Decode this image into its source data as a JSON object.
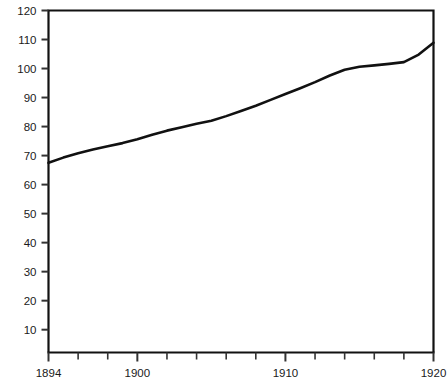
{
  "chart_data": {
    "type": "line",
    "title": "",
    "subtitle": "",
    "xlabel": "",
    "ylabel": "",
    "xlim": [
      1894,
      1920
    ],
    "ylim": [
      0,
      120
    ],
    "grid": false,
    "legend": null,
    "x_major_ticks": [
      1894,
      1900,
      1910,
      1920
    ],
    "x_major_tick_labels": [
      "1894",
      "1900",
      "1910",
      "1920"
    ],
    "x_minor_ticks": [
      1896,
      1898,
      1902,
      1904,
      1906,
      1908,
      1912,
      1914,
      1916,
      1918
    ],
    "y_ticks": [
      10,
      20,
      30,
      40,
      50,
      60,
      70,
      80,
      90,
      100,
      110,
      120
    ],
    "y_tick_labels": [
      "10",
      "20",
      "30",
      "40",
      "50",
      "60",
      "70",
      "80",
      "90",
      "100",
      "110",
      "120"
    ],
    "series": [
      {
        "name": "series-1",
        "color": "#111111",
        "line_width": 2.6,
        "x": [
          1894,
          1895,
          1896,
          1897,
          1898,
          1899,
          1900,
          1901,
          1902,
          1903,
          1904,
          1905,
          1906,
          1907,
          1908,
          1909,
          1910,
          1911,
          1912,
          1913,
          1914,
          1915,
          1916,
          1917,
          1918,
          1919,
          1920
        ],
        "values": [
          67.5,
          69.3,
          70.8,
          72.1,
          73.2,
          74.3,
          75.6,
          77.2,
          78.6,
          79.8,
          81.0,
          82.0,
          83.6,
          85.4,
          87.2,
          89.2,
          91.2,
          93.2,
          95.3,
          97.6,
          99.6,
          100.6,
          101.1,
          101.6,
          102.2,
          104.8,
          108.9
        ]
      }
    ]
  },
  "axes": {
    "frame_color": "#111111",
    "tick_color": "#333333",
    "label_color": "#1a1a1a"
  }
}
